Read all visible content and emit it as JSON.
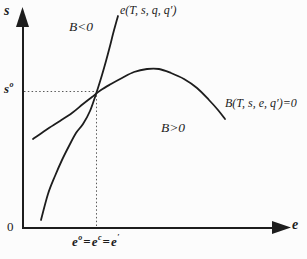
{
  "colors": {
    "ink": "#1d1d1d",
    "background": "#fcfcfc",
    "guide": "#5a5a5a"
  },
  "labels": {
    "y_axis": "s",
    "x_axis": "e",
    "origin": "0",
    "region_upper": "B<0",
    "region_lower": "B>0",
    "curve_e": "e(T, s, q, q′)",
    "curve_B": "B(T, s, e, q′)=0"
  },
  "ticks": {
    "s_base": "s",
    "s_sup": "o",
    "e1_base": "e",
    "e1_sup": "o",
    "eq1": "=",
    "e2_base": "e",
    "e2_sup": "c",
    "eq2": "=",
    "e3_base": "e",
    "e3_sup": "′"
  },
  "curves": {
    "e_curve": {
      "label": "e(T, s, q, q′)",
      "points": [
        [
          41,
          220
        ],
        [
          48,
          194
        ],
        [
          55,
          176
        ],
        [
          62,
          160
        ],
        [
          69,
          146
        ],
        [
          76,
          133
        ],
        [
          83,
          124
        ],
        [
          90,
          111
        ],
        [
          97,
          91
        ],
        [
          102,
          75
        ],
        [
          106,
          61
        ],
        [
          110,
          46
        ],
        [
          113,
          34
        ],
        [
          116,
          23
        ],
        [
          118,
          16
        ]
      ]
    },
    "B_curve": {
      "label": "B(T, s, e, q′)=0",
      "points": [
        [
          33,
          139
        ],
        [
          46,
          130
        ],
        [
          60,
          121
        ],
        [
          72,
          113
        ],
        [
          83,
          104
        ],
        [
          92,
          97
        ],
        [
          101,
          90
        ],
        [
          111,
          84
        ],
        [
          122,
          78
        ],
        [
          134,
          72
        ],
        [
          147,
          69
        ],
        [
          159,
          69
        ],
        [
          171,
          73
        ],
        [
          184,
          79
        ],
        [
          197,
          88
        ],
        [
          209,
          100
        ],
        [
          218,
          110
        ],
        [
          225,
          119
        ]
      ]
    }
  },
  "guides": {
    "horizontal": [
      [
        24,
        91.5
      ],
      [
        96.5,
        91.5
      ]
    ],
    "vertical": [
      [
        96.5,
        91.5
      ],
      [
        96.5,
        226
      ]
    ]
  }
}
